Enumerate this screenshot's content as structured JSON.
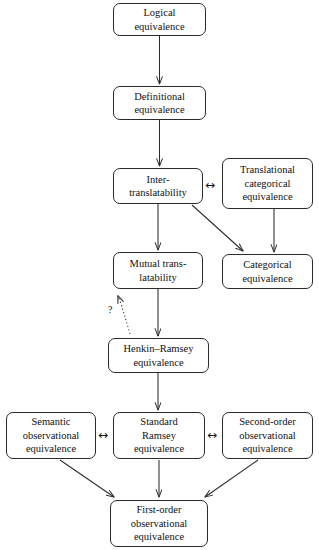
{
  "diagram": {
    "background_color": "#ffffff",
    "stroke_color": "#2b2b2b",
    "text_color": "#111111",
    "nodes": [
      {
        "id": "logical",
        "label": "Logical\nequivalence",
        "x": 113,
        "y": 3,
        "w": 93,
        "h": 33
      },
      {
        "id": "definitional",
        "label": "Definitional\nequivalence",
        "x": 113,
        "y": 86,
        "w": 93,
        "h": 34
      },
      {
        "id": "inter",
        "label": "Inter-\ntranslatability",
        "x": 113,
        "y": 168,
        "w": 90,
        "h": 36
      },
      {
        "id": "transcat",
        "label": "Translational\ncategorical\nequivalence",
        "x": 222,
        "y": 158,
        "w": 91,
        "h": 51
      },
      {
        "id": "mutual",
        "label": "Mutual trans-\nlatability",
        "x": 113,
        "y": 252,
        "w": 90,
        "h": 37
      },
      {
        "id": "categorical",
        "label": "Categorical\nequivalence",
        "x": 222,
        "y": 254,
        "w": 91,
        "h": 35
      },
      {
        "id": "henkin",
        "label": "Henkin–Ramsey\nequivalence",
        "x": 108,
        "y": 338,
        "w": 101,
        "h": 35
      },
      {
        "id": "semantic",
        "label": "Semantic\nobservational\nequivalence",
        "x": 6,
        "y": 412,
        "w": 90,
        "h": 47
      },
      {
        "id": "ramsey",
        "label": "Standard\nRamsey\nequivalence",
        "x": 113,
        "y": 412,
        "w": 92,
        "h": 47
      },
      {
        "id": "secondorder",
        "label": "Second-order\nobservational\nequivalence",
        "x": 222,
        "y": 412,
        "w": 91,
        "h": 47
      },
      {
        "id": "firstorder",
        "label": "First-order\nobservational\nequivalence",
        "x": 110,
        "y": 500,
        "w": 98,
        "h": 47
      }
    ],
    "bidirectional_markers": [
      {
        "id": "inter-transcat",
        "glyph": "↔",
        "x": 205,
        "y": 179
      },
      {
        "id": "semantic-ramsey",
        "glyph": "↔",
        "x": 98,
        "y": 429
      },
      {
        "id": "ramsey-secondorder",
        "glyph": "↔",
        "x": 207,
        "y": 429
      }
    ],
    "annotations": [
      {
        "id": "uncertain-link",
        "label": "?",
        "x": 108,
        "y": 305
      }
    ],
    "edges": [
      {
        "from": "logical",
        "to": "definitional",
        "style": "solid",
        "kind": "arrow"
      },
      {
        "from": "definitional",
        "to": "inter",
        "style": "solid",
        "kind": "arrow"
      },
      {
        "from": "inter",
        "to": "mutual",
        "style": "solid",
        "kind": "arrow"
      },
      {
        "from": "inter",
        "to": "categorical",
        "style": "solid",
        "kind": "arrow"
      },
      {
        "from": "transcat",
        "to": "categorical",
        "style": "solid",
        "kind": "arrow"
      },
      {
        "from": "mutual",
        "to": "henkin",
        "style": "solid",
        "kind": "arrow"
      },
      {
        "from": "henkin",
        "to": "mutual",
        "style": "dotted",
        "kind": "arrow"
      },
      {
        "from": "henkin",
        "to": "ramsey",
        "style": "solid",
        "kind": "arrow"
      },
      {
        "from": "semantic",
        "to": "firstorder",
        "style": "solid",
        "kind": "arrow"
      },
      {
        "from": "ramsey",
        "to": "firstorder",
        "style": "solid",
        "kind": "arrow"
      },
      {
        "from": "secondorder",
        "to": "firstorder",
        "style": "solid",
        "kind": "arrow"
      }
    ]
  }
}
